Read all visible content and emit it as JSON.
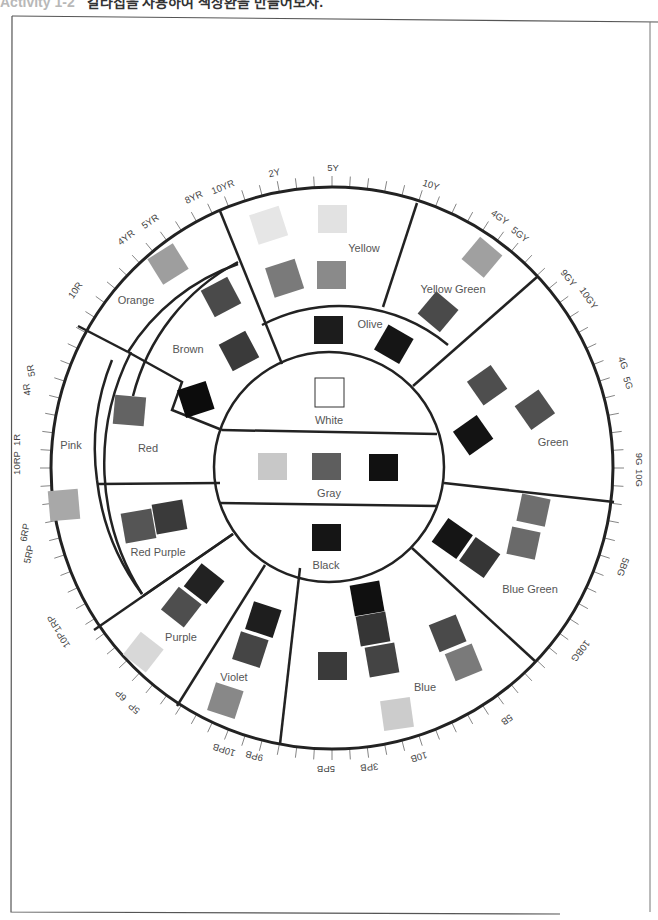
{
  "header": {
    "activity": "Activity 1-2",
    "instruction": "칼라칩을 사용하여 색상환을 만들어보자."
  },
  "wheel": {
    "center": {
      "white": {
        "label": "White",
        "chips": [
          "#ffffff"
        ]
      },
      "gray": {
        "label": "Gray",
        "chips": [
          "#c8c8c8",
          "#5e5e5e",
          "#111111"
        ]
      },
      "black": {
        "label": "Black",
        "chips": [
          "#151515"
        ]
      }
    },
    "segments": {
      "yellow": {
        "label": "Yellow",
        "chips": [
          "#e6e6e6",
          "#e2e2e2",
          "#7a7a7a",
          "#8a8a8a"
        ]
      },
      "olive": {
        "label": "Olive",
        "chips": [
          "#1c1c1c",
          "#151515"
        ]
      },
      "yellow_green": {
        "label": "Yellow Green",
        "chips": [
          "#a0a0a0",
          "#4a4a4a"
        ]
      },
      "green": {
        "label": "Green",
        "chips": [
          "#4e4e4e",
          "#505050",
          "#131313"
        ]
      },
      "blue_green": {
        "label": "Blue Green",
        "chips": [
          "#6e6e6e",
          "#6a6a6a",
          "#151515",
          "#353535"
        ]
      },
      "blue": {
        "label": "Blue",
        "chips": [
          "#101010",
          "#353535",
          "#444444",
          "#3a3a3a",
          "#4a4a4a",
          "#7a7a7a",
          "#cccccc"
        ]
      },
      "violet": {
        "label": "Violet",
        "chips": [
          "#1e1e1e",
          "#454545",
          "#888888"
        ]
      },
      "purple": {
        "label": "Purple",
        "chips": [
          "#222222",
          "#4e4e4e",
          "#d8d8d8"
        ]
      },
      "red_purple": {
        "label": "Red Purple",
        "chips": [
          "#555555",
          "#3a3a3a"
        ]
      },
      "pink": {
        "label": "Pink",
        "chips": [
          "#a8a8a8"
        ]
      },
      "red": {
        "label": "Red",
        "chips": [
          "#636363"
        ]
      },
      "brown": {
        "label": "Brown",
        "chips": [
          "#4a4a4a",
          "#3a3a3a",
          "#0c0c0c"
        ]
      },
      "orange": {
        "label": "Orange",
        "chips": [
          "#9e9e9e"
        ]
      }
    },
    "tick_labels": [
      "2Y",
      "5Y",
      "10Y",
      "4GY",
      "5GY",
      "9GY",
      "10GY",
      "4G",
      "5G",
      "9G",
      "10G",
      "5BG",
      "10BG",
      "5B",
      "10B",
      "3PB",
      "5PB",
      "9PB",
      "10PB",
      "5P",
      "6P",
      "10P",
      "1RP",
      "5RP",
      "6RP",
      "10RP",
      "1R",
      "4R",
      "5R",
      "10R",
      "4YR",
      "5YR",
      "8YR",
      "10YR"
    ]
  }
}
